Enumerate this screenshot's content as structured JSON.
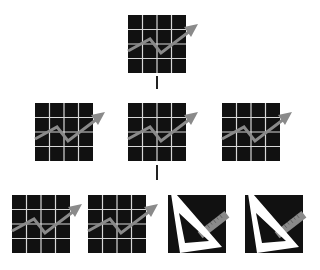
{
  "diagram": {
    "type": "tree",
    "colors": {
      "background": "#ffffff",
      "tile": "#111111",
      "grid_lines": "#d8d8d8",
      "chart_line": "#8a8a8a",
      "triangle": "#ffffff",
      "ruler": "#8a8a8a",
      "connector": "#222222"
    },
    "nodes": [
      {
        "id": "root",
        "icon": "growth-chart-icon",
        "row": 0,
        "x": 128,
        "y": 15
      },
      {
        "id": "child-left",
        "icon": "growth-chart-icon",
        "row": 1,
        "x": 35,
        "y": 103
      },
      {
        "id": "child-center",
        "icon": "growth-chart-icon",
        "row": 1,
        "x": 128,
        "y": 103
      },
      {
        "id": "child-right",
        "icon": "growth-chart-icon",
        "row": 1,
        "x": 222,
        "y": 103
      },
      {
        "id": "leaf-1",
        "icon": "growth-chart-icon",
        "row": 2,
        "x": 12,
        "y": 195
      },
      {
        "id": "leaf-2",
        "icon": "growth-chart-icon",
        "row": 2,
        "x": 88,
        "y": 195
      },
      {
        "id": "leaf-3",
        "icon": "set-square-ruler-icon",
        "row": 2,
        "x": 168,
        "y": 195
      },
      {
        "id": "leaf-4",
        "icon": "set-square-ruler-icon",
        "row": 2,
        "x": 245,
        "y": 195
      }
    ],
    "edges": [
      {
        "from": "root",
        "to": "child-center"
      },
      {
        "from": "child-center",
        "to": "leaf-3"
      }
    ]
  }
}
